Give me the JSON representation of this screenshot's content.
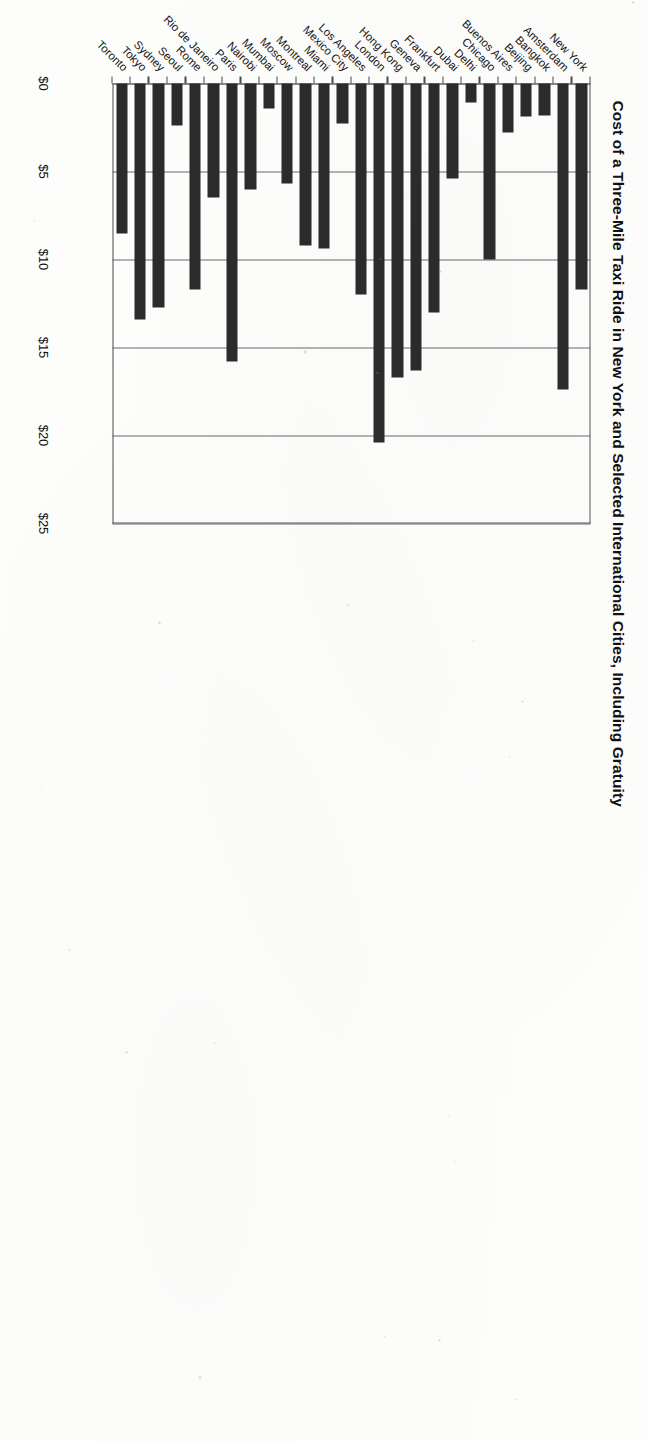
{
  "chart_data": {
    "type": "bar",
    "orientation": "horizontal",
    "title": "Cost of a Three-Mile Taxi Ride in New York and Selected International Cities, Including Gratuity",
    "xlabel": "",
    "ylabel": "",
    "xlim": [
      0,
      25
    ],
    "grid": true,
    "legend": "none",
    "tick_labels": [
      "$0",
      "$5",
      "$10",
      "$15",
      "$20",
      "$25"
    ],
    "tick_values": [
      0,
      5,
      10,
      15,
      20,
      25
    ],
    "categories": [
      "New York",
      "Amsterdam",
      "Bangkok",
      "Beijing",
      "Buenos Aires",
      "Chicago",
      "Delhi",
      "Dubai",
      "Frankfurt",
      "Geneva",
      "Hong Kong",
      "London",
      "Los Angeles",
      "Mexico City",
      "Miami",
      "Montreal",
      "Moscow",
      "Mumbai",
      "Nairobi",
      "Paris",
      "Rio de Janeiro",
      "Rome",
      "Seoul",
      "Sydney",
      "Tokyo",
      "Toronto"
    ],
    "values": [
      11.7,
      17.4,
      1.8,
      1.9,
      2.8,
      10.0,
      1.1,
      5.4,
      13.0,
      16.3,
      16.7,
      20.4,
      12.0,
      2.3,
      9.4,
      9.2,
      5.7,
      1.4,
      6.0,
      15.8,
      6.5,
      11.7,
      2.4,
      12.7,
      13.4,
      8.5
    ],
    "series_name": "Cost (USD)",
    "bar_color": "#2b2b2b"
  }
}
